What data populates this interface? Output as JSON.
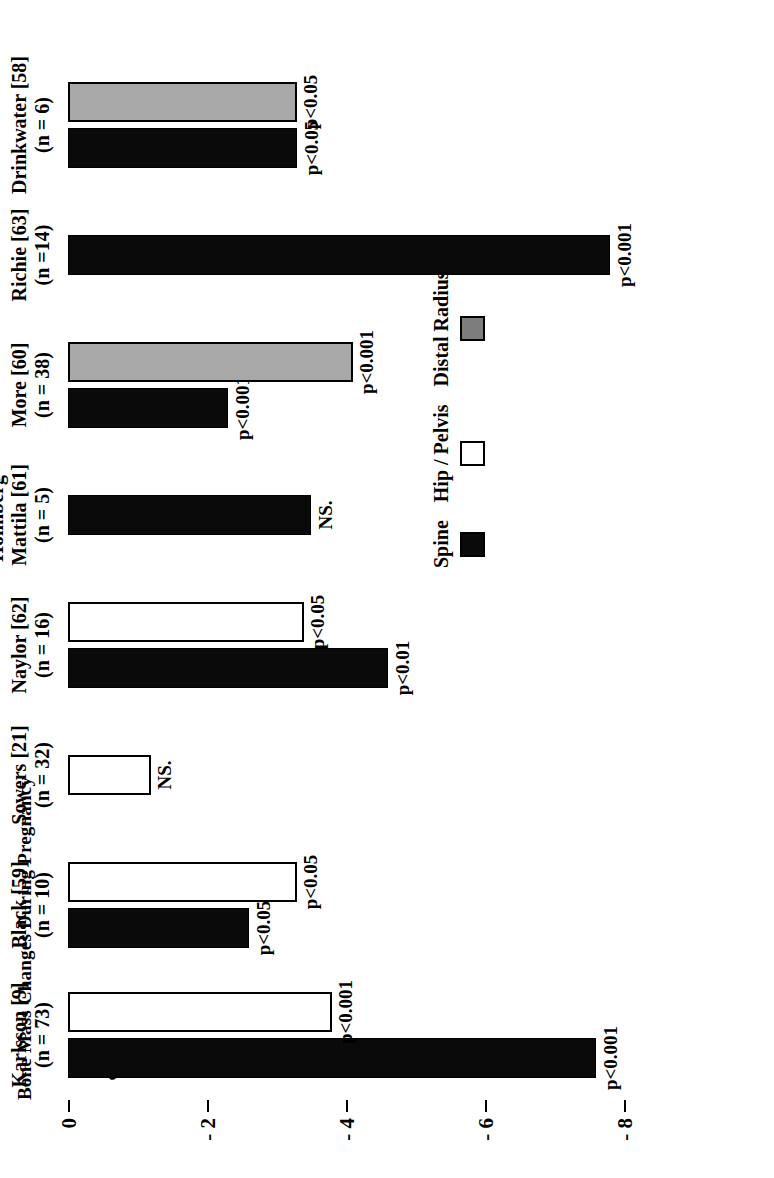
{
  "chart_data": {
    "type": "bar",
    "title": "Bone Mass Changes During Pregnancy",
    "xlabel": "",
    "ylabel": "%",
    "ylim": [
      -8,
      0
    ],
    "yticks": [
      "0",
      "- 2",
      "- 4",
      "- 6",
      "- 8"
    ],
    "ytick_values": [
      0,
      -2,
      -4,
      -6,
      -8
    ],
    "grid": false,
    "orientation": "vertical-bars-rotated-page",
    "legend_position": "bottom-right",
    "legend": [
      {
        "name": "Spine",
        "color": "#0a0a0a"
      },
      {
        "name": "Hip / Pelvis",
        "color": "#ffffff"
      },
      {
        "name": "Distal Radius",
        "color": "#7d7d7d"
      }
    ],
    "categories": [
      "Karlsson [9]",
      "Black [59]",
      "Sowers [21]",
      "Naylor [62]",
      "Holmberg-Mattila [61]",
      "More [60]",
      "Richie [63]",
      "Drinkwater [58]"
    ],
    "category_subtitles": [
      "(n = 73)",
      "(n = 10)",
      "(n = 32)",
      "(n = 16)",
      "(n = 5)",
      "(n = 38)",
      "(n =14)",
      "(n = 6)"
    ],
    "series": [
      {
        "name": "Spine",
        "values": [
          -7.6,
          -2.6,
          null,
          -4.6,
          -3.5,
          -2.3,
          -7.8,
          -3.3
        ]
      },
      {
        "name": "Hip / Pelvis",
        "values": [
          -3.8,
          -3.3,
          -1.2,
          -3.4,
          null,
          null,
          null,
          null
        ]
      },
      {
        "name": "Distal Radius",
        "values": [
          null,
          null,
          null,
          null,
          null,
          -4.1,
          null,
          -3.3
        ]
      }
    ],
    "annotations": [
      {
        "name": "Spine",
        "labels": [
          "p<0.001",
          "p<0.05",
          null,
          "p<0.01",
          "NS.",
          "p<0.001",
          "p<0.001",
          "p<0.05"
        ]
      },
      {
        "name": "Hip / Pelvis",
        "labels": [
          "p<0.001",
          "p<0.05",
          "NS.",
          "p<0.05",
          null,
          null,
          null,
          null
        ]
      },
      {
        "name": "Distal Radius",
        "labels": [
          null,
          null,
          null,
          null,
          null,
          "p<0.001",
          null,
          "p<0.05"
        ]
      }
    ]
  },
  "groups": [
    {
      "label": "Karlsson [9]",
      "n": "(n = 73)",
      "bars": [
        {
          "series": "Spine",
          "value": -7.6,
          "sig": "p<0.001"
        },
        {
          "series": "Hip / Pelvis",
          "value": -3.8,
          "sig": "p<0.001"
        }
      ]
    },
    {
      "label": "Black [59]",
      "n": "(n = 10)",
      "bars": [
        {
          "series": "Spine",
          "value": -2.6,
          "sig": "p<0.05"
        },
        {
          "series": "Hip / Pelvis",
          "value": -3.3,
          "sig": "p<0.05"
        }
      ]
    },
    {
      "label": "Sowers [21]",
      "n": "(n = 32)",
      "bars": [
        {
          "series": "Hip / Pelvis",
          "value": -1.2,
          "sig": "NS."
        }
      ]
    },
    {
      "label": "Naylor [62]",
      "n": "(n = 16)",
      "bars": [
        {
          "series": "Spine",
          "value": -4.6,
          "sig": "p<0.01"
        },
        {
          "series": "Hip / Pelvis",
          "value": -3.4,
          "sig": "p<0.05"
        }
      ]
    },
    {
      "label": "Holmberg-\nMattila [61]",
      "n": "(n = 5)",
      "bars": [
        {
          "series": "Spine",
          "value": -3.5,
          "sig": "NS."
        }
      ]
    },
    {
      "label": "More [60]",
      "n": "(n = 38)",
      "bars": [
        {
          "series": "Spine",
          "value": -2.3,
          "sig": "p<0.001"
        },
        {
          "series": "Distal Radius",
          "value": -4.1,
          "sig": "p<0.001"
        }
      ]
    },
    {
      "label": "Richie [63]",
      "n": "(n =14)",
      "bars": [
        {
          "series": "Spine",
          "value": -7.8,
          "sig": "p<0.001"
        }
      ]
    },
    {
      "label": "Drinkwater [58]",
      "n": "(n = 6)",
      "bars": [
        {
          "series": "Spine",
          "value": -3.3,
          "sig": "p<0.05"
        },
        {
          "series": "Distal Radius",
          "value": -3.3,
          "sig": "p<0.05"
        }
      ]
    }
  ],
  "axis": {
    "pct_symbol": "%",
    "ticks": [
      "0",
      "- 2",
      "- 4",
      "- 6",
      "- 8"
    ]
  },
  "legend": {
    "items": [
      {
        "label": "Spine",
        "swatch": "spine"
      },
      {
        "label": "Hip / Pelvis",
        "swatch": "hip"
      },
      {
        "label": "Distal Radius",
        "swatch": "radius"
      }
    ]
  },
  "title": "Bone Mass Changes During Pregnancy"
}
